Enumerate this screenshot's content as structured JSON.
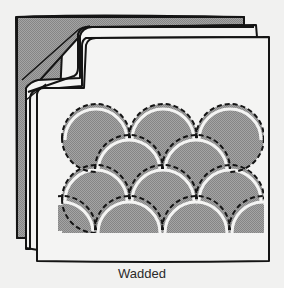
{
  "figure": {
    "caption": "Wadded",
    "colors": {
      "background": "#f1f1f0",
      "outline": "#141414",
      "fill_gray": "#9a9a9a",
      "fill_white": "#f4f4f3",
      "stitch": "#1a1a1a"
    },
    "layers": [
      "backing",
      "wadding",
      "lining",
      "top"
    ],
    "pattern": {
      "type": "clamshell",
      "rows": 4,
      "shells_per_row": [
        3,
        2,
        3,
        3
      ]
    }
  }
}
